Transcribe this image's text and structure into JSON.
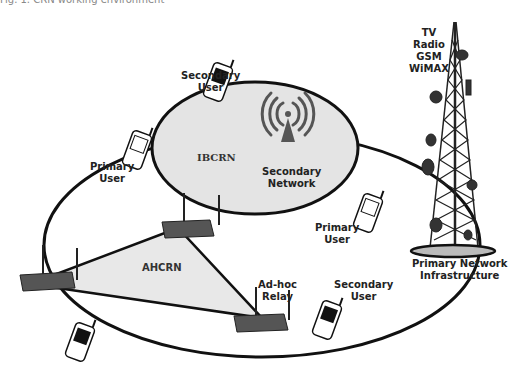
{
  "caption": "Fig. 1. CRN working environment",
  "labels": {
    "ibcrn": "IBCRN",
    "ahcrn": "AHCRN",
    "secondary_network": [
      "Secondary",
      "Network"
    ],
    "secondary_user_top": [
      "Secondary",
      "User"
    ],
    "primary_user_left": [
      "Primary",
      "User"
    ],
    "primary_user_right": [
      "Primary",
      "User"
    ],
    "secondary_user_bottom": [
      "Secondary",
      "User"
    ],
    "adhoc_relay": [
      "Ad-hoc",
      "Relay"
    ],
    "tower_services": [
      "TV",
      "Radio",
      "GSM",
      "WiMAX"
    ],
    "primary_infrastructure": [
      "Primary Network",
      "Infrastructure"
    ]
  },
  "colors": {
    "ibcrn_fill": "#e4e4e4",
    "ahcrn_fill": "#e8e8e8",
    "outline": "#111111",
    "antenna": "#555555",
    "tower": "#2a2a2a"
  }
}
